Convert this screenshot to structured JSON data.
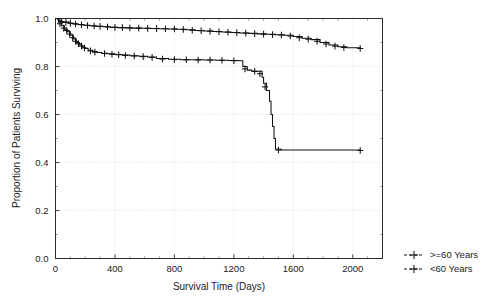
{
  "chart_data": {
    "type": "line",
    "title": "",
    "xlabel": "Survival Time (Days)",
    "ylabel": "Proportion of Patients Surviving",
    "xlim": [
      0,
      2200
    ],
    "ylim": [
      0.0,
      1.0
    ],
    "xticks": [
      0,
      400,
      800,
      1200,
      1600,
      2000
    ],
    "xtick_labels": [
      "0",
      "400",
      "800",
      "1200",
      "1600",
      "2000"
    ],
    "yticks": [
      0.0,
      0.2,
      0.4,
      0.6,
      0.8,
      1.0
    ],
    "ytick_labels": [
      "0.0",
      "0.2",
      "0.4",
      "0.6",
      "0.8",
      "1.0"
    ],
    "grid": true,
    "legend_position": "right-bottom-outside",
    "legend_entries": [
      ">=60 Years",
      "<60 Years"
    ],
    "series": [
      {
        "name": ">=60 Years",
        "note": "upper Kaplan-Meier curve, ends near 0.875",
        "steps": [
          [
            0,
            1.0
          ],
          [
            15,
            0.995
          ],
          [
            30,
            0.99
          ],
          [
            45,
            0.985
          ],
          [
            60,
            0.985
          ],
          [
            90,
            0.98
          ],
          [
            120,
            0.978
          ],
          [
            150,
            0.975
          ],
          [
            190,
            0.972
          ],
          [
            230,
            0.97
          ],
          [
            270,
            0.968
          ],
          [
            320,
            0.966
          ],
          [
            370,
            0.963
          ],
          [
            420,
            0.962
          ],
          [
            470,
            0.961
          ],
          [
            520,
            0.96
          ],
          [
            580,
            0.959
          ],
          [
            640,
            0.958
          ],
          [
            700,
            0.957
          ],
          [
            760,
            0.956
          ],
          [
            820,
            0.955
          ],
          [
            880,
            0.953
          ],
          [
            940,
            0.95
          ],
          [
            1000,
            0.948
          ],
          [
            1060,
            0.946
          ],
          [
            1120,
            0.944
          ],
          [
            1180,
            0.942
          ],
          [
            1240,
            0.94
          ],
          [
            1300,
            0.938
          ],
          [
            1360,
            0.936
          ],
          [
            1420,
            0.934
          ],
          [
            1480,
            0.932
          ],
          [
            1540,
            0.93
          ],
          [
            1600,
            0.925
          ],
          [
            1660,
            0.918
          ],
          [
            1720,
            0.912
          ],
          [
            1780,
            0.9
          ],
          [
            1840,
            0.89
          ],
          [
            1900,
            0.882
          ],
          [
            1960,
            0.878
          ],
          [
            2050,
            0.875
          ]
        ],
        "censor_points": [
          [
            40,
            0.987
          ],
          [
            70,
            0.984
          ],
          [
            100,
            0.98
          ],
          [
            135,
            0.977
          ],
          [
            175,
            0.974
          ],
          [
            215,
            0.971
          ],
          [
            260,
            0.969
          ],
          [
            300,
            0.967
          ],
          [
            350,
            0.965
          ],
          [
            400,
            0.963
          ],
          [
            450,
            0.962
          ],
          [
            500,
            0.961
          ],
          [
            560,
            0.96
          ],
          [
            620,
            0.959
          ],
          [
            680,
            0.958
          ],
          [
            740,
            0.957
          ],
          [
            800,
            0.956
          ],
          [
            860,
            0.954
          ],
          [
            920,
            0.951
          ],
          [
            980,
            0.949
          ],
          [
            1040,
            0.947
          ],
          [
            1100,
            0.945
          ],
          [
            1160,
            0.943
          ],
          [
            1220,
            0.941
          ],
          [
            1280,
            0.939
          ],
          [
            1340,
            0.937
          ],
          [
            1400,
            0.935
          ],
          [
            1460,
            0.933
          ],
          [
            1520,
            0.931
          ],
          [
            1580,
            0.927
          ],
          [
            1640,
            0.92
          ],
          [
            1700,
            0.914
          ],
          [
            1760,
            0.905
          ],
          [
            1820,
            0.894
          ],
          [
            1880,
            0.885
          ],
          [
            1940,
            0.879
          ],
          [
            2050,
            0.875
          ]
        ]
      },
      {
        "name": "<60 Years",
        "note": "lower Kaplan-Meier curve, plateaus near 0.45 after 1450 days",
        "steps": [
          [
            0,
            1.0
          ],
          [
            20,
            0.985
          ],
          [
            40,
            0.97
          ],
          [
            60,
            0.955
          ],
          [
            80,
            0.945
          ],
          [
            100,
            0.93
          ],
          [
            120,
            0.915
          ],
          [
            140,
            0.9
          ],
          [
            160,
            0.89
          ],
          [
            180,
            0.88
          ],
          [
            200,
            0.875
          ],
          [
            220,
            0.868
          ],
          [
            250,
            0.862
          ],
          [
            280,
            0.858
          ],
          [
            310,
            0.855
          ],
          [
            350,
            0.853
          ],
          [
            400,
            0.85
          ],
          [
            450,
            0.848
          ],
          [
            500,
            0.845
          ],
          [
            560,
            0.843
          ],
          [
            620,
            0.84
          ],
          [
            680,
            0.833
          ],
          [
            760,
            0.83
          ],
          [
            840,
            0.828
          ],
          [
            920,
            0.828
          ],
          [
            1000,
            0.827
          ],
          [
            1080,
            0.826
          ],
          [
            1160,
            0.825
          ],
          [
            1230,
            0.824
          ],
          [
            1260,
            0.8
          ],
          [
            1290,
            0.785
          ],
          [
            1320,
            0.78
          ],
          [
            1360,
            0.78
          ],
          [
            1390,
            0.755
          ],
          [
            1400,
            0.73
          ],
          [
            1420,
            0.7
          ],
          [
            1440,
            0.655
          ],
          [
            1450,
            0.6
          ],
          [
            1460,
            0.55
          ],
          [
            1470,
            0.5
          ],
          [
            1480,
            0.455
          ],
          [
            1520,
            0.452
          ],
          [
            2050,
            0.45
          ]
        ],
        "censor_points": [
          [
            30,
            0.978
          ],
          [
            55,
            0.96
          ],
          [
            75,
            0.95
          ],
          [
            95,
            0.935
          ],
          [
            115,
            0.92
          ],
          [
            135,
            0.905
          ],
          [
            155,
            0.895
          ],
          [
            175,
            0.885
          ],
          [
            195,
            0.877
          ],
          [
            235,
            0.865
          ],
          [
            265,
            0.86
          ],
          [
            330,
            0.854
          ],
          [
            380,
            0.851
          ],
          [
            425,
            0.849
          ],
          [
            470,
            0.846
          ],
          [
            530,
            0.844
          ],
          [
            590,
            0.841
          ],
          [
            650,
            0.838
          ],
          [
            720,
            0.831
          ],
          [
            800,
            0.829
          ],
          [
            880,
            0.828
          ],
          [
            960,
            0.827
          ],
          [
            1040,
            0.827
          ],
          [
            1120,
            0.826
          ],
          [
            1200,
            0.824
          ],
          [
            1275,
            0.79
          ],
          [
            1340,
            0.78
          ],
          [
            1375,
            0.77
          ],
          [
            1410,
            0.715
          ],
          [
            1500,
            0.452
          ],
          [
            2050,
            0.45
          ]
        ]
      }
    ]
  },
  "axes": {
    "x_title": "Survival Time (Days)",
    "y_title": "Proportion of Patients Surviving"
  },
  "legend": {
    "items": [
      {
        "label": ">=60 Years"
      },
      {
        "label": "<60 Years"
      }
    ]
  }
}
